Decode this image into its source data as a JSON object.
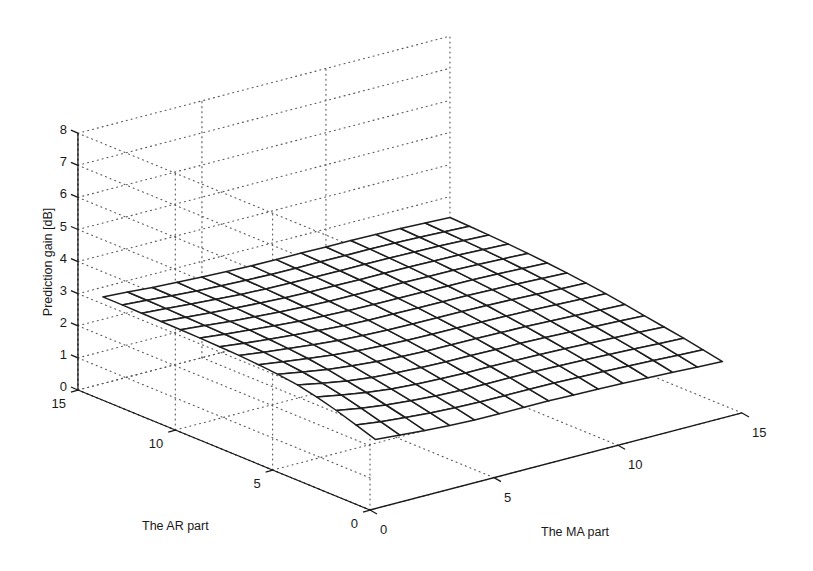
{
  "chart_data": {
    "type": "surface",
    "title": "",
    "xlabel": "The MA part",
    "ylabel": "The AR part",
    "zlabel": "Prediction gain [dB]",
    "x_ticks": [
      0,
      5,
      10,
      15
    ],
    "y_ticks": [
      0,
      5,
      10,
      15
    ],
    "z_ticks": [
      0,
      1,
      2,
      3,
      4,
      5,
      6,
      7,
      8
    ],
    "xlim": [
      0,
      15
    ],
    "ylim": [
      0,
      15
    ],
    "zlim": [
      0,
      8
    ],
    "grid": true,
    "style": "mesh (wireframe, white faces)",
    "x": [
      1,
      2,
      3,
      4,
      5,
      6,
      7,
      8,
      9,
      10,
      11,
      12,
      13,
      14,
      15
    ],
    "y": [
      1,
      2,
      3,
      4,
      5,
      6,
      7,
      8,
      9,
      10,
      11,
      12,
      13,
      14,
      15
    ],
    "z_note": "rows indexed by AR order (y = 1..15), columns by MA order (x = 1..15); values estimated from the rendered surface",
    "z": [
      [
        1.75,
        1.68,
        1.62,
        1.58,
        1.55,
        1.54,
        1.54,
        1.54,
        1.52,
        1.5,
        1.48,
        1.45,
        1.42,
        1.38,
        1.35
      ],
      [
        1.95,
        1.85,
        1.78,
        1.72,
        1.68,
        1.66,
        1.65,
        1.65,
        1.64,
        1.62,
        1.6,
        1.57,
        1.54,
        1.5,
        1.47
      ],
      [
        2.15,
        2.02,
        1.92,
        1.85,
        1.8,
        1.77,
        1.76,
        1.76,
        1.75,
        1.73,
        1.71,
        1.68,
        1.65,
        1.61,
        1.58
      ],
      [
        2.32,
        2.18,
        2.06,
        1.97,
        1.91,
        1.88,
        1.86,
        1.86,
        1.85,
        1.83,
        1.81,
        1.78,
        1.75,
        1.72,
        1.68
      ],
      [
        2.45,
        2.3,
        2.17,
        2.08,
        2.02,
        1.98,
        1.96,
        1.95,
        1.94,
        1.93,
        1.91,
        1.88,
        1.85,
        1.82,
        1.78
      ],
      [
        2.53,
        2.4,
        2.28,
        2.19,
        2.12,
        2.08,
        2.05,
        2.04,
        2.03,
        2.02,
        2.0,
        1.97,
        1.94,
        1.91,
        1.88
      ],
      [
        2.58,
        2.47,
        2.37,
        2.28,
        2.21,
        2.16,
        2.13,
        2.12,
        2.11,
        2.1,
        2.08,
        2.06,
        2.03,
        2.0,
        1.97
      ],
      [
        2.62,
        2.52,
        2.43,
        2.35,
        2.28,
        2.23,
        2.2,
        2.19,
        2.18,
        2.17,
        2.16,
        2.14,
        2.11,
        2.08,
        2.05
      ],
      [
        2.64,
        2.55,
        2.47,
        2.4,
        2.34,
        2.29,
        2.26,
        2.25,
        2.24,
        2.23,
        2.22,
        2.2,
        2.18,
        2.15,
        2.12
      ],
      [
        2.66,
        2.58,
        2.51,
        2.44,
        2.38,
        2.34,
        2.31,
        2.3,
        2.29,
        2.28,
        2.27,
        2.26,
        2.24,
        2.21,
        2.18
      ],
      [
        2.67,
        2.6,
        2.53,
        2.47,
        2.42,
        2.38,
        2.35,
        2.34,
        2.33,
        2.33,
        2.32,
        2.31,
        2.29,
        2.26,
        2.23
      ],
      [
        2.68,
        2.61,
        2.55,
        2.5,
        2.45,
        2.41,
        2.39,
        2.38,
        2.37,
        2.37,
        2.36,
        2.35,
        2.33,
        2.3,
        2.27
      ],
      [
        2.69,
        2.63,
        2.57,
        2.52,
        2.47,
        2.44,
        2.42,
        2.41,
        2.4,
        2.4,
        2.39,
        2.38,
        2.36,
        2.33,
        2.3
      ],
      [
        2.7,
        2.64,
        2.58,
        2.53,
        2.49,
        2.46,
        2.44,
        2.43,
        2.43,
        2.42,
        2.42,
        2.41,
        2.39,
        2.36,
        2.33
      ],
      [
        2.7,
        2.65,
        2.59,
        2.55,
        2.51,
        2.48,
        2.46,
        2.45,
        2.45,
        2.44,
        2.44,
        2.43,
        2.41,
        2.38,
        2.35
      ]
    ],
    "view": {
      "origin_px": [
        370,
        510
      ],
      "x_unit_px": [
        24.8,
        -6.47
      ],
      "y_unit_px": [
        -19.47,
        -8.0
      ],
      "z_unit_px": [
        0,
        -32.1
      ]
    },
    "labels": {
      "z_tick_text": [
        "0",
        "1",
        "2",
        "3",
        "4",
        "5",
        "6",
        "7",
        "8"
      ],
      "x_tick_text": [
        "0",
        "5",
        "10",
        "15"
      ],
      "y_tick_text": [
        "0",
        "5",
        "10",
        "15"
      ]
    }
  }
}
